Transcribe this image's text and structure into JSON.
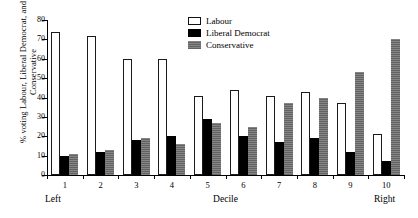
{
  "chart_data": {
    "type": "bar",
    "title": "",
    "xlabel": "Decile",
    "ylabel": "% voting Labour, Liberal Democrat, and Conservative",
    "categories": [
      "1",
      "2",
      "3",
      "4",
      "5",
      "6",
      "7",
      "8",
      "9",
      "10"
    ],
    "xlim_labels": {
      "left": "Left",
      "right": "Right"
    },
    "ylim": [
      0,
      80
    ],
    "yticks": [
      0,
      10,
      20,
      30,
      40,
      50,
      60,
      70,
      80
    ],
    "ytick_labels": [
      "0",
      "10",
      "20",
      "30",
      "40",
      "50",
      "60",
      "70",
      "80"
    ],
    "grid": false,
    "legend_position": "top-center",
    "series": [
      {
        "name": "Labour",
        "color": "#ffffff",
        "edge_color": "#1a1a1a",
        "swatch": "open-box",
        "values": [
          74,
          72,
          60,
          60,
          41,
          44,
          41,
          43,
          37,
          21
        ]
      },
      {
        "name": "Liberal Democrat",
        "color": "#000000",
        "edge_color": "#000000",
        "swatch": "filled-black-box",
        "values": [
          10,
          12,
          18,
          20,
          29,
          20,
          17,
          19,
          12,
          7
        ]
      },
      {
        "name": "Conservative",
        "color": "#6e6e6e",
        "edge_color": "#4a4a4a",
        "swatch": "filled-gray-box",
        "values": [
          11,
          13,
          19,
          16,
          27,
          25,
          37,
          40,
          53,
          70
        ]
      }
    ]
  },
  "legend": {
    "entries": [
      {
        "label": "Labour"
      },
      {
        "label": "Liberal Democrat"
      },
      {
        "label": "Conservative"
      }
    ]
  },
  "axes": {
    "y_title": "% voting Labour, Liberal Democrat, and Conservative",
    "x_title": "Decile",
    "left_anchor": "Left",
    "right_anchor": "Right"
  }
}
